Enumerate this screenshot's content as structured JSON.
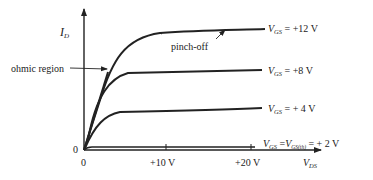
{
  "diagram": {
    "y_axis": {
      "label": "I",
      "label_sub": "D"
    },
    "x_axis": {
      "label": "V",
      "label_sub": "DS",
      "ticks": [
        {
          "value": 0,
          "label": "0"
        },
        {
          "value": 10,
          "label": "+10 V"
        },
        {
          "value": 20,
          "label": "+20 V"
        }
      ]
    },
    "origin_y_label": "0",
    "annotations": {
      "ohmic": "ohmic region",
      "pinch": "pinch-off"
    },
    "curves": [
      {
        "name": "V",
        "sub": "GS",
        "eq": " = +12 V"
      },
      {
        "name": "V",
        "sub": "GS",
        "eq": " = +8 V"
      },
      {
        "name": "V",
        "sub": "GS",
        "eq": " = + 4 V"
      },
      {
        "name": "V",
        "sub": "GS",
        "eq": " =",
        "name2": "V",
        "sub2": "GS(th)",
        "eq2": " = + 2 V"
      }
    ],
    "colors": {
      "ink": "#222222",
      "background": "#ffffff"
    }
  }
}
